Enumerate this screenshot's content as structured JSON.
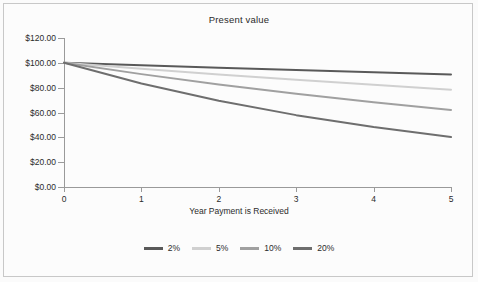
{
  "chart_data": {
    "type": "line",
    "title": "Present value",
    "xlabel": "Year Payment is Received",
    "ylabel": "",
    "xlim": [
      0,
      5
    ],
    "ylim": [
      0,
      120
    ],
    "grid": false,
    "legend_position": "bottom",
    "x": [
      0,
      1,
      2,
      3,
      4,
      5
    ],
    "xtick_labels": [
      "0",
      "1",
      "2",
      "3",
      "4",
      "5"
    ],
    "ytick_values": [
      0,
      20,
      40,
      60,
      80,
      100,
      120
    ],
    "ytick_labels": [
      "$0.00",
      "$20.00",
      "$40.00",
      "$60.00",
      "$80.00",
      "$100.00",
      "$120.00"
    ],
    "series": [
      {
        "name": "2%",
        "color": "#595959",
        "values": [
          100.0,
          98.04,
          96.12,
          94.23,
          92.38,
          90.57
        ]
      },
      {
        "name": "5%",
        "color": "#d0d0d0",
        "values": [
          100.0,
          95.24,
          90.7,
          86.38,
          82.27,
          78.35
        ]
      },
      {
        "name": "10%",
        "color": "#a0a0a0",
        "values": [
          100.0,
          90.91,
          82.64,
          75.13,
          68.3,
          62.09
        ]
      },
      {
        "name": "20%",
        "color": "#6e6e6e",
        "values": [
          100.0,
          83.33,
          69.44,
          57.87,
          48.23,
          40.19
        ]
      }
    ]
  },
  "legend": {
    "items": [
      {
        "label": "2%",
        "color": "#595959"
      },
      {
        "label": "5%",
        "color": "#d0d0d0"
      },
      {
        "label": "10%",
        "color": "#a0a0a0"
      },
      {
        "label": "20%",
        "color": "#6e6e6e"
      }
    ]
  },
  "colors": {
    "background": "#fbfbfb",
    "plot_background": "#fcfcfc",
    "border": "#c8c8c8",
    "axis": "#9a9a9a",
    "text": "#2b2b2b"
  }
}
